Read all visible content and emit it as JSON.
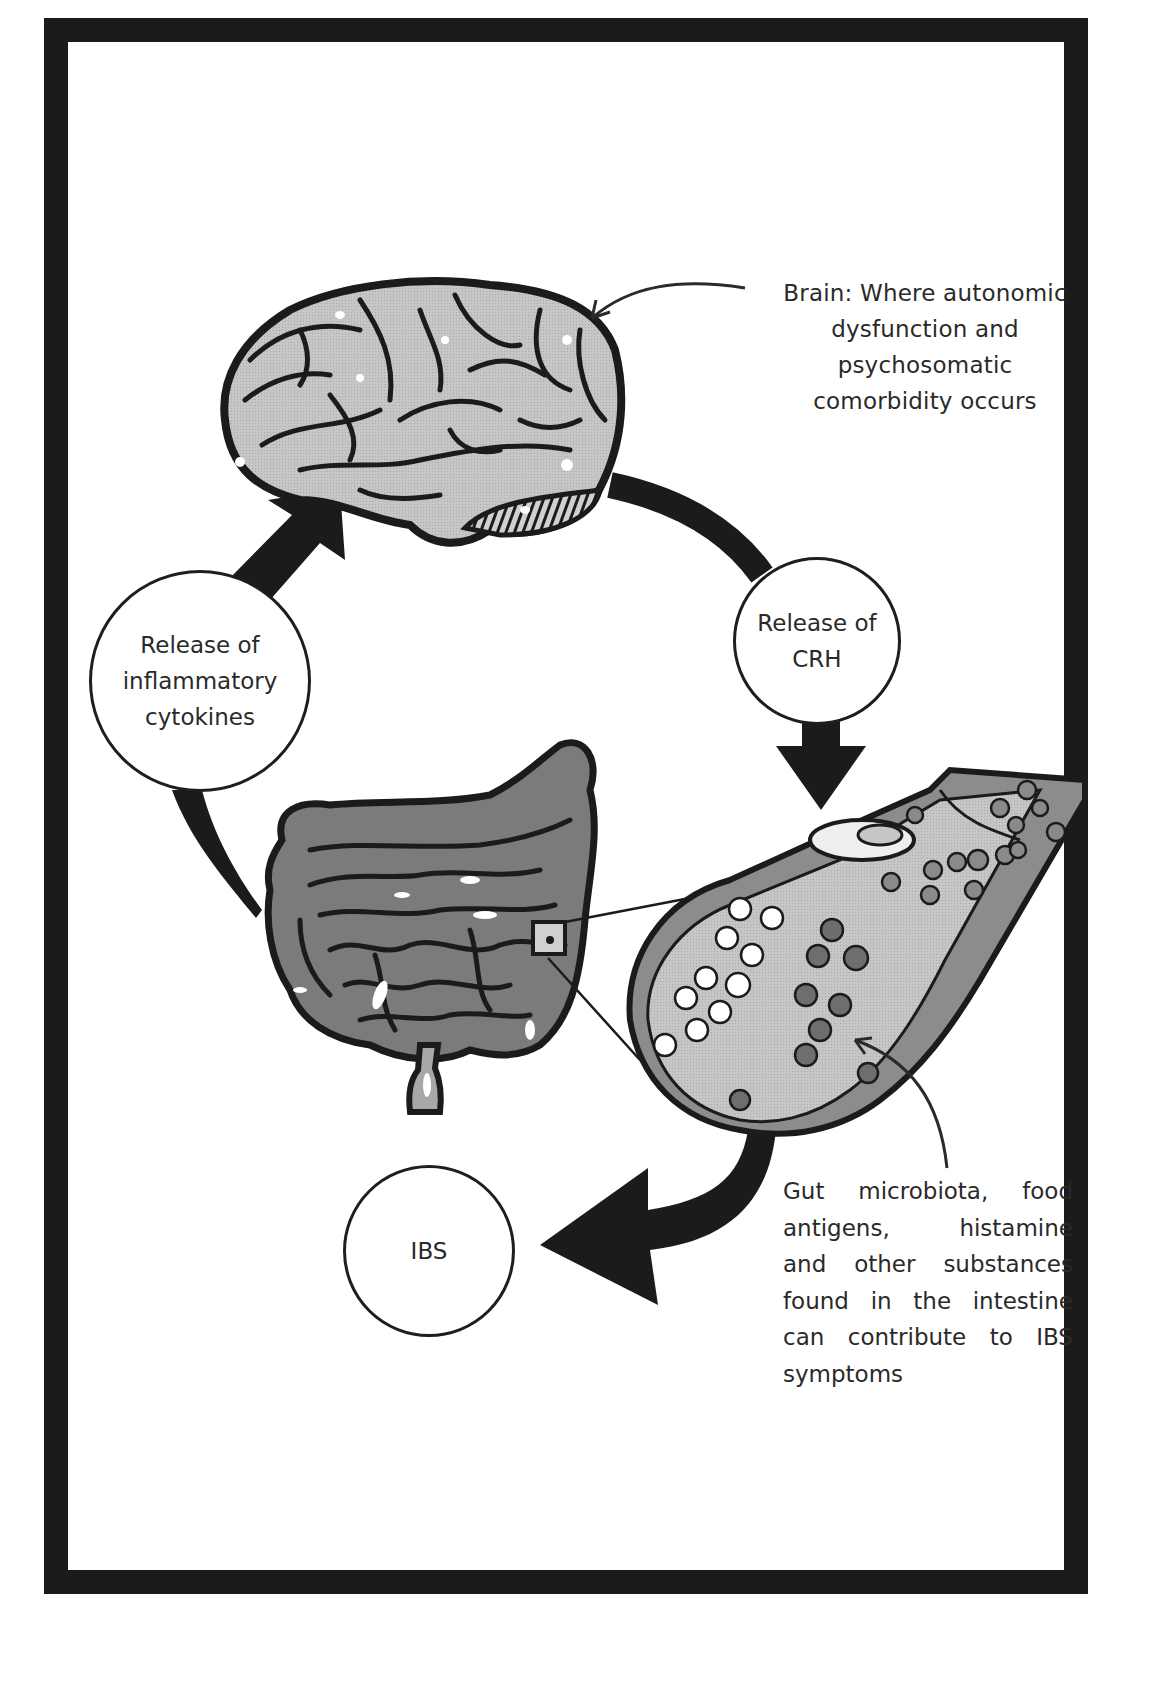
{
  "diagram": {
    "type": "cycle",
    "colors": {
      "frame": "#1b1b1b",
      "arrow": "#1b1b1b",
      "brain_fill": "#c4c4c4",
      "intestine_fill": "#7d7d7d",
      "tube_fill": "#bdbdbd",
      "particle_dark": "#6e6e6e",
      "particle_light": "#ffffff"
    },
    "brain_label": {
      "lines": [
        "Brain: Where autonomic",
        "dysfunction and",
        "psychosomatic",
        "comorbidity occurs"
      ]
    },
    "nodes": {
      "crh": {
        "lines": [
          "Release of",
          "CRH"
        ]
      },
      "cytokines": {
        "lines": [
          "Release of",
          "inflammatory",
          "cytokines"
        ]
      },
      "ibs": {
        "lines": [
          "IBS"
        ]
      }
    },
    "gut_label": {
      "lines": [
        [
          "Gut",
          "microbiota,",
          "food"
        ],
        [
          "antigens,",
          "histamine"
        ],
        [
          "and",
          "other",
          "substances"
        ],
        [
          "found",
          "in",
          "the",
          "intestine"
        ],
        [
          "can",
          "contribute",
          "to",
          "IBS"
        ],
        [
          "symptoms"
        ]
      ]
    },
    "flow": [
      {
        "from": "Brain",
        "to": "Release of CRH"
      },
      {
        "from": "Release of CRH",
        "to": "Intestinal lumen"
      },
      {
        "from": "Intestinal lumen",
        "to": "IBS"
      },
      {
        "from": "Intestine",
        "to": "Release of inflammatory cytokines"
      },
      {
        "from": "Release of inflammatory cytokines",
        "to": "Brain"
      }
    ]
  }
}
